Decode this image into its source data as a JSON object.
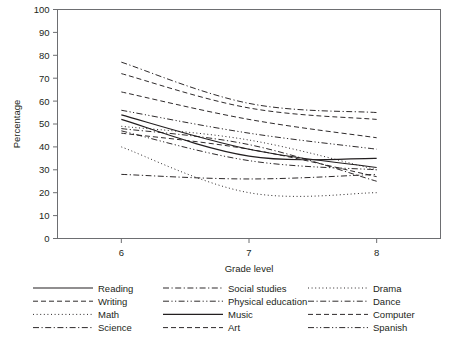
{
  "chart_data": {
    "type": "line",
    "title": "",
    "xlabel": "Grade level",
    "ylabel": "Percentage",
    "x": [
      6,
      7,
      8
    ],
    "xtick_labels": [
      "6",
      "7",
      "8"
    ],
    "ytick_labels": [
      "0",
      "10",
      "20",
      "30",
      "40",
      "50",
      "60",
      "70",
      "80",
      "90",
      "100"
    ],
    "ylim": [
      0,
      100
    ],
    "xlim": [
      5.5,
      8.5
    ],
    "grid": false,
    "legend_position": "below-plot",
    "legend_columns": 3,
    "series": [
      {
        "name": "Reading",
        "style": "solid",
        "values": [
          54,
          39,
          31
        ]
      },
      {
        "name": "Writing",
        "style": "dashed",
        "values": [
          46,
          39,
          27
        ]
      },
      {
        "name": "Math",
        "style": "dotted",
        "values": [
          40,
          20,
          20
        ]
      },
      {
        "name": "Science",
        "style": "dashdot",
        "values": [
          48,
          41,
          25
        ]
      },
      {
        "name": "Social studies",
        "style": "dashdot",
        "values": [
          77,
          59,
          55
        ]
      },
      {
        "name": "Physical education",
        "style": "dashdotdot",
        "values": [
          56,
          46,
          39
        ]
      },
      {
        "name": "Music",
        "style": "solid",
        "values": [
          52,
          36,
          35
        ]
      },
      {
        "name": "Art",
        "style": "dashed",
        "values": [
          72,
          57,
          52
        ]
      },
      {
        "name": "Drama",
        "style": "dotted",
        "values": [
          49,
          43,
          30
        ]
      },
      {
        "name": "Dance",
        "style": "dashdot",
        "values": [
          28,
          26,
          28
        ]
      },
      {
        "name": "Computer",
        "style": "dashed",
        "values": [
          64,
          52,
          44
        ]
      },
      {
        "name": "Spanish",
        "style": "dashdotdot",
        "values": [
          47,
          34,
          30
        ]
      }
    ]
  },
  "legend": {
    "columns": [
      {
        "items": [
          "Reading",
          "Writing",
          "Math",
          "Science"
        ]
      },
      {
        "items": [
          "Social studies",
          "Physical education",
          "Music",
          "Art"
        ]
      },
      {
        "items": [
          "Drama",
          "Dance",
          "Computer",
          "Spanish"
        ]
      }
    ]
  },
  "colors": {
    "ink": "#231f20",
    "frame": "#6d6e71",
    "background": "#ffffff"
  }
}
